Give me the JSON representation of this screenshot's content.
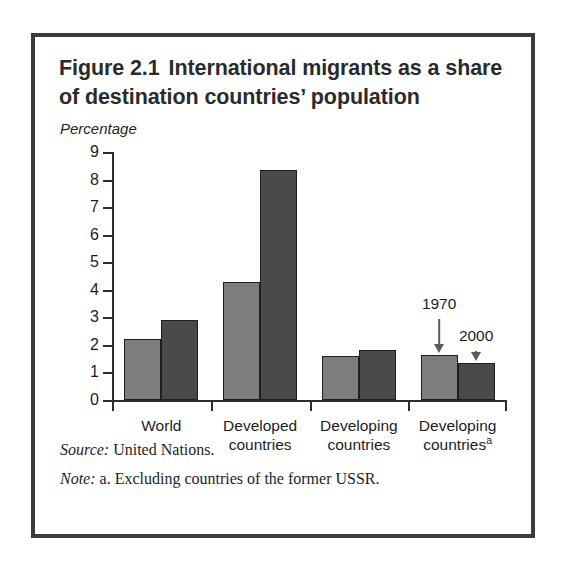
{
  "figure": {
    "title_number": "Figure 2.1",
    "title_text": "International migrants as a share of destination countries’ population",
    "source_label": "Source:",
    "source_text": "United Nations.",
    "note_label": "Note:",
    "note_text": "a. Excluding countries of the former USSR.",
    "footnote_marker": "a"
  },
  "annotations": [
    {
      "label": "1970",
      "series": "1970",
      "target_group": "Developing countriesᵃ"
    },
    {
      "label": "2000",
      "series": "2000",
      "target_group": "Developing countriesᵃ"
    }
  ],
  "colors": {
    "series_1970": "#7d7d7d",
    "series_2000": "#4a4a4a",
    "bar_outline": "#1f1f1f",
    "axis": "#2d2d2d",
    "frame": "#3b3b3b",
    "text": "#1d1d1d",
    "background": "#ffffff"
  },
  "chart_data": {
    "type": "bar",
    "subtitle": "",
    "xlabel": "",
    "ylabel": "Percentage",
    "ylim": [
      0,
      9
    ],
    "yticks": [
      0,
      1,
      2,
      3,
      4,
      5,
      6,
      7,
      8,
      9
    ],
    "ytick_labels": [
      "0",
      "1",
      "2",
      "3",
      "4",
      "5",
      "6",
      "7",
      "8",
      "9"
    ],
    "grid": false,
    "legend": "annotated-arrows",
    "categories": [
      "World",
      "Developed countries",
      "Developing countries",
      "Developing countriesᵃ"
    ],
    "category_lines": [
      [
        "World"
      ],
      [
        "Developed",
        "countries"
      ],
      [
        "Developing",
        "countries"
      ],
      [
        "Developing",
        "countries"
      ]
    ],
    "series": [
      {
        "name": "1970",
        "values": [
          2.2,
          4.3,
          1.6,
          1.65
        ]
      },
      {
        "name": "2000",
        "values": [
          2.9,
          8.35,
          1.83,
          1.35
        ]
      }
    ]
  }
}
